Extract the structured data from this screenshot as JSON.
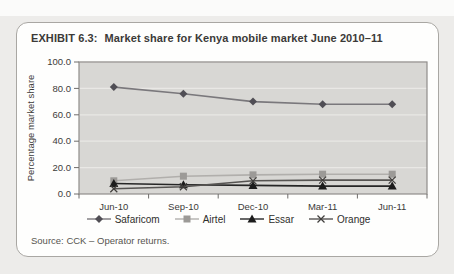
{
  "page": {
    "title_prefix": "EXHIBIT 6.3:",
    "title_text": "Market share for Kenya mobile market June 2010–11",
    "source": "Source: CCK – Operator returns."
  },
  "colors": {
    "page_background": "#edecea",
    "card_background": "#fefefd",
    "card_border": "#a9a7a3",
    "plot_background": "#d8d7d4",
    "gridline": "#e9e8e5",
    "plot_border": "#8f8d8a",
    "tick": "#6f6d6b",
    "tick_label": "#3c3b39"
  },
  "chart_data": {
    "type": "line",
    "title": "Market share for Kenya mobile market June 2010–11",
    "categories": [
      "Jun-10",
      "Sep-10",
      "Dec-10",
      "Mar-11",
      "Jun-11"
    ],
    "series": [
      {
        "name": "Safaricom",
        "marker": "diamond",
        "values": [
          81,
          76,
          70,
          68,
          68
        ],
        "line_color": "#7a787c",
        "marker_color": "#504e55"
      },
      {
        "name": "Airtel",
        "marker": "square",
        "values": [
          10,
          13.5,
          14.5,
          15,
          15
        ],
        "line_color": "#b1afac",
        "marker_color": "#9c9a97"
      },
      {
        "name": "Essar",
        "marker": "triangle",
        "values": [
          8,
          7,
          6.5,
          6,
          6
        ],
        "line_color": "#262626",
        "marker_color": "#1c1c1c"
      },
      {
        "name": "Orange",
        "marker": "x",
        "values": [
          4,
          5.5,
          10,
          10.5,
          10.5
        ],
        "line_color": "#565452",
        "marker_color": "#403e3c"
      }
    ],
    "xlabel": "",
    "ylabel": "Percentage market share",
    "ylim": [
      0,
      100
    ],
    "ytick_step": 20,
    "ytick_decimals": 1,
    "grid": true,
    "legend_position": "bottom"
  }
}
